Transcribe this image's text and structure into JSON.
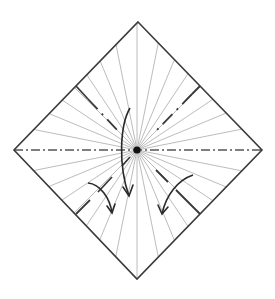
{
  "diagram": {
    "type": "origami-crease-pattern",
    "shape": "square-on-point",
    "colors": {
      "edge": "#3a3a3a",
      "ray": "#b4b4b4",
      "axis": "#555555",
      "arrow": "#2a2a2a",
      "center_dot": "#111111"
    },
    "vertices": {
      "top": [
        138,
        22
      ],
      "right": [
        262,
        150
      ],
      "bottom": [
        137,
        279
      ],
      "left": [
        14,
        150
      ],
      "center": [
        137,
        150
      ]
    },
    "radial_divisions": 32,
    "horizontal_fold": "mountain (dash-dot)",
    "arrows": [
      {
        "name": "center-arrow",
        "from": [
          130,
          108
        ],
        "to": [
          129,
          195
        ]
      },
      {
        "name": "left-arrow",
        "from": [
          88,
          183
        ],
        "to": [
          112,
          213
        ]
      },
      {
        "name": "right-arrow",
        "from": [
          193,
          175
        ],
        "to": [
          162,
          213
        ]
      }
    ]
  }
}
